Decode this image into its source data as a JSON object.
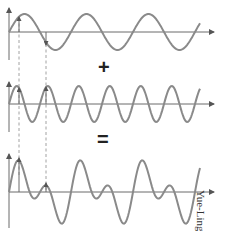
{
  "diagram": {
    "operators": {
      "plus": "+",
      "equals": "="
    },
    "credit": "Yue-Ling Wong",
    "colors": {
      "wave": "#8a8a8a",
      "axis": "#6a6a6a",
      "dashed_guides": "#8a8a8a"
    },
    "panels": [
      {
        "name": "wave-1",
        "frequency": 1,
        "amplitude": 1,
        "baseline_y": 32
      },
      {
        "name": "wave-2",
        "frequency": 2,
        "amplitude": 1,
        "baseline_y": 104
      },
      {
        "name": "sum",
        "formula": "wave-1 + wave-2",
        "baseline_y": 192
      }
    ],
    "guides": [
      {
        "x": 19,
        "label": "sample point 1"
      },
      {
        "x": 46,
        "label": "sample point 2"
      }
    ]
  }
}
